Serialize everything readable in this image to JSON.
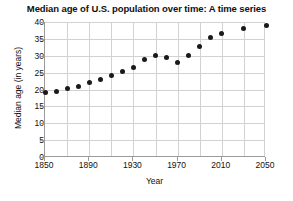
{
  "chart_data": {
    "type": "scatter",
    "title": "Median age of U.S. population over time: A time series",
    "xlabel": "Year",
    "ylabel": "Median age (in years)",
    "xlim": [
      1850,
      2050
    ],
    "ylim": [
      0,
      40
    ],
    "grid": true,
    "legend": "none",
    "marker": "filled-circle",
    "marker_color": "#1a1a1a",
    "x_tick_labels": [
      "1850",
      "1890",
      "1930",
      "1970",
      "2010",
      "2050"
    ],
    "x_ticks": [
      1850,
      1890,
      1930,
      1970,
      2010,
      2050
    ],
    "x_minor_step": 20,
    "y_tick_labels": [
      "0",
      "5",
      "10",
      "15",
      "20",
      "25",
      "30",
      "35",
      "40"
    ],
    "y_ticks": [
      0,
      5,
      10,
      15,
      20,
      25,
      30,
      35,
      40
    ],
    "x": [
      1850,
      1860,
      1870,
      1880,
      1890,
      1900,
      1910,
      1920,
      1930,
      1940,
      1950,
      1960,
      1970,
      1980,
      1990,
      2000,
      2010,
      2030,
      2050
    ],
    "values": [
      19.0,
      19.4,
      20.2,
      20.9,
      22.0,
      22.9,
      24.1,
      25.3,
      26.5,
      29.0,
      30.2,
      29.5,
      28.1,
      30.0,
      32.8,
      35.3,
      36.6,
      38.0,
      39.0
    ],
    "series": [
      {
        "name": "Median age",
        "values": [
          19.0,
          19.4,
          20.2,
          20.9,
          22.0,
          22.9,
          24.1,
          25.3,
          26.5,
          29.0,
          30.2,
          29.5,
          28.1,
          30.0,
          32.8,
          35.3,
          36.6,
          38.0,
          39.0
        ]
      }
    ]
  }
}
